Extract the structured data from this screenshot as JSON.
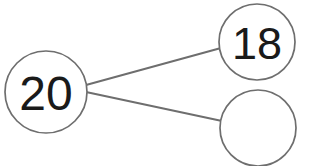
{
  "diagram": {
    "type": "number-bond",
    "background_color": "#ffffff",
    "stroke_color": "#6e6e6e",
    "text_color": "#1a1a1a",
    "total": {
      "label": "20",
      "has_value": true,
      "role": "whole",
      "cx": 46,
      "cy": 92,
      "r": 41
    },
    "parts": [
      {
        "label": "18",
        "has_value": true,
        "role": "part",
        "cx": 257,
        "cy": 42,
        "r": 38
      },
      {
        "label": "",
        "has_value": false,
        "role": "part-blank",
        "cx": 258,
        "cy": 128,
        "r": 38
      }
    ],
    "links": [
      {
        "from": "total",
        "to": "part-18",
        "x1": 86,
        "y1": 85,
        "x2": 221,
        "y2": 48
      },
      {
        "from": "total",
        "to": "part-blank",
        "x1": 86,
        "y1": 92,
        "x2": 222,
        "y2": 121
      }
    ]
  }
}
